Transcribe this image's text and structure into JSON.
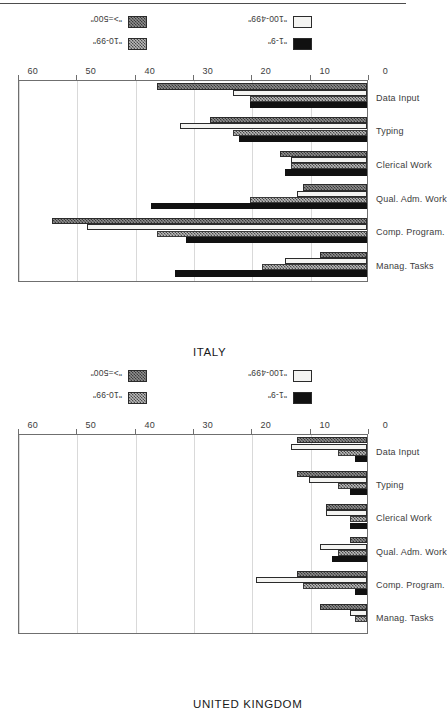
{
  "figure": {
    "orientation": "rotated-90-ccw",
    "panel_order": [
      "italy",
      "united_kingdom"
    ],
    "axis": {
      "ticks": [
        0,
        10,
        20,
        30,
        40,
        50,
        60
      ],
      "min": 0,
      "max": 60,
      "gridlines": true
    },
    "categories": [
      "Manag. Tasks",
      "Comp. Program.",
      "Qual. Adm. Work",
      "Clerical Work",
      "Typing",
      "Data Input"
    ],
    "legend": {
      "position": "right-outside",
      "entries": [
        {
          "label": "\"1-9\"",
          "swatch": "solid-black",
          "color": "#111111"
        },
        {
          "label": "\"10-99\"",
          "swatch": "dense-hatch",
          "color": "#b9b9b9"
        },
        {
          "label": "\"100-499\"",
          "swatch": "white-outline",
          "color": "#f4f4f2"
        },
        {
          "label": "\">=500\"",
          "swatch": "dark-hatch",
          "color": "#8e8e8e"
        }
      ]
    }
  },
  "chart_data": [
    {
      "type": "bar",
      "title": "ITALY",
      "xlabel": "",
      "ylabel": "",
      "ylim": [
        0,
        60
      ],
      "yticks": [
        0,
        10,
        20,
        30,
        40,
        50,
        60
      ],
      "grid": true,
      "legend_position": "right",
      "categories": [
        "Manag. Tasks",
        "Comp. Program.",
        "Qual. Adm. Work",
        "Clerical Work",
        "Typing",
        "Data Input"
      ],
      "series": [
        {
          "name": "\"1-9\"",
          "values": [
            33,
            31,
            37,
            14,
            22,
            20
          ]
        },
        {
          "name": "\"10-99\"",
          "values": [
            18,
            36,
            20,
            13,
            23,
            20
          ]
        },
        {
          "name": "\"100-499\"",
          "values": [
            14,
            48,
            12,
            13,
            32,
            23
          ]
        },
        {
          "name": "\">=500\"",
          "values": [
            8,
            54,
            11,
            15,
            27,
            36
          ]
        }
      ]
    },
    {
      "type": "bar",
      "title": "UNITED KINGDOM",
      "xlabel": "",
      "ylabel": "",
      "ylim": [
        0,
        60
      ],
      "yticks": [
        0,
        10,
        20,
        30,
        40,
        50,
        60
      ],
      "grid": true,
      "legend_position": "right",
      "categories": [
        "Manag. Tasks",
        "Comp. Program.",
        "Qual. Adm. Work",
        "Clerical Work",
        "Typing",
        "Data Input"
      ],
      "series": [
        {
          "name": "\"1-9\"",
          "values": [
            0,
            2,
            6,
            3,
            3,
            2
          ]
        },
        {
          "name": "\"10-99\"",
          "values": [
            2,
            11,
            5,
            3,
            5,
            5
          ]
        },
        {
          "name": "\"100-499\"",
          "values": [
            3,
            19,
            8,
            7,
            10,
            13
          ]
        },
        {
          "name": "\">=500\"",
          "values": [
            8,
            12,
            3,
            7,
            12,
            12
          ]
        }
      ]
    }
  ]
}
